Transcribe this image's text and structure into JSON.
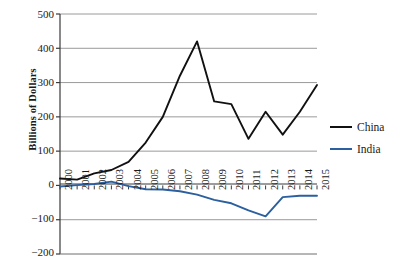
{
  "chart_data": {
    "type": "line",
    "title": "",
    "xlabel": "",
    "ylabel": "Billions of Dollars",
    "categories": [
      "2000",
      "2001",
      "2002",
      "2003",
      "2004",
      "2005",
      "2006",
      "2007",
      "2008",
      "2009",
      "2010",
      "2011",
      "2012",
      "2013",
      "2014",
      "2015"
    ],
    "x": [
      2000,
      2001,
      2002,
      2003,
      2004,
      2005,
      2006,
      2007,
      2008,
      2009,
      2010,
      2011,
      2012,
      2013,
      2014,
      2015
    ],
    "series": [
      {
        "name": "China",
        "color": "#111111",
        "values": [
          20,
          17,
          35,
          45,
          69,
          125,
          200,
          320,
          420,
          245,
          237,
          136,
          215,
          148,
          215,
          293
        ]
      },
      {
        "name": "India",
        "color": "#2b5f9e",
        "values": [
          -3,
          1,
          4,
          11,
          -2,
          -11,
          -12,
          -17,
          -27,
          -42,
          -52,
          -73,
          -90,
          -34,
          -30,
          -30
        ]
      }
    ],
    "ylim": [
      -200,
      500
    ],
    "yticks": [
      500,
      400,
      300,
      200,
      100,
      0,
      -100,
      -200
    ],
    "ytick_labels": [
      "500",
      "400",
      "300",
      "200",
      "100",
      "0",
      "−100",
      "−200"
    ],
    "xlim": [
      2000,
      2015
    ],
    "grid": "horizontal",
    "grid_color": "#9a9a9a",
    "axis_color": "#3a3a3a",
    "legend_position": "right",
    "legend": [
      {
        "label": "China",
        "color": "#111111"
      },
      {
        "label": "India",
        "color": "#2b5f9e"
      }
    ]
  }
}
